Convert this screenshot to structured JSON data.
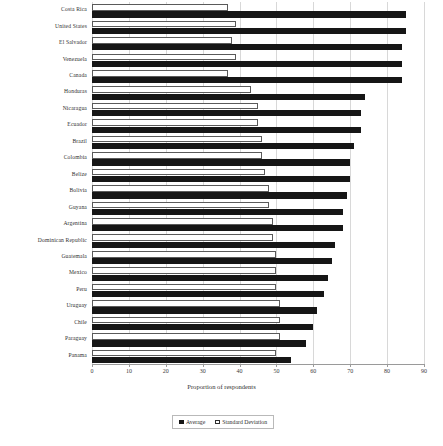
{
  "chart_data": {
    "type": "bar",
    "orientation": "horizontal",
    "title": "",
    "xlabel": "Proportion of respondents",
    "ylabel": "",
    "xlim": [
      0,
      90
    ],
    "xticks": [
      0,
      10,
      20,
      30,
      40,
      50,
      60,
      70,
      80,
      90
    ],
    "grid": true,
    "legend_position": "bottom-center",
    "categories": [
      "Costa Rica",
      "United States",
      "El Salvador",
      "Venezuela",
      "Canada",
      "Honduras",
      "Nicaragua",
      "Ecuador",
      "Brazil",
      "Colombia",
      "Belize",
      "Bolivia",
      "Guyana",
      "Argentina",
      "Dominican Republic",
      "Guatemala",
      "Mexico",
      "Peru",
      "Uruguay",
      "Chile",
      "Paraguay",
      "Panama"
    ],
    "series": [
      {
        "name": "Average",
        "color": "#161616",
        "values": [
          85,
          85,
          84,
          84,
          84,
          74,
          73,
          73,
          71,
          70,
          70,
          69,
          68,
          68,
          66,
          65,
          64,
          63,
          61,
          60,
          58,
          54
        ]
      },
      {
        "name": "Standard Deviation",
        "color": "#ffffff",
        "values": [
          37,
          39,
          38,
          39,
          37,
          43,
          45,
          45,
          46,
          46,
          47,
          48,
          48,
          49,
          49,
          50,
          50,
          50,
          51,
          51,
          51,
          50
        ]
      }
    ]
  },
  "legend": {
    "items": [
      {
        "label": "Average",
        "marker": "filled-square"
      },
      {
        "label": "Standard Deviation",
        "marker": "hollow-square"
      }
    ]
  },
  "axis": {
    "x_title": "Proportion of respondents"
  }
}
